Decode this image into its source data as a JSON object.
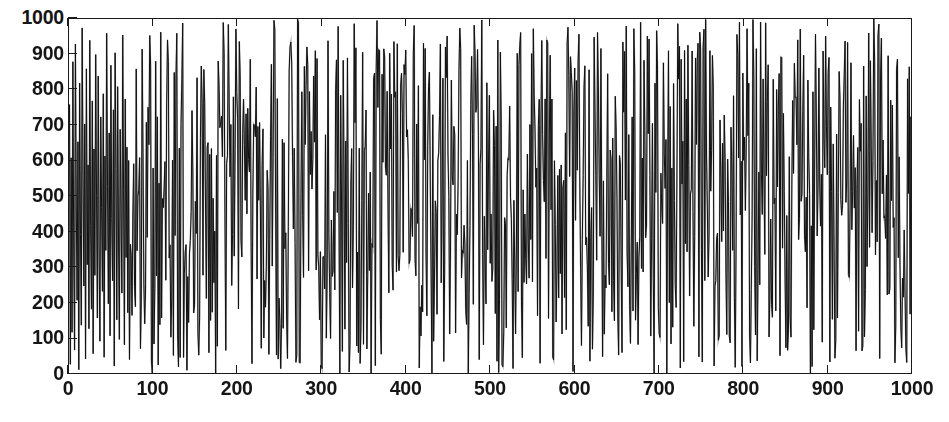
{
  "figure": {
    "background_color": "#ffffff",
    "ink_color": "#1a1a1a",
    "caption_remnant": ""
  },
  "chart_data": {
    "type": "line",
    "title": "",
    "subtitle": "",
    "xlabel": "",
    "ylabel": "",
    "xlim": [
      0,
      1000
    ],
    "ylim": [
      0,
      1000
    ],
    "xticks": [
      0,
      100,
      200,
      300,
      400,
      500,
      600,
      700,
      800,
      900,
      1000
    ],
    "yticks": [
      0,
      100,
      200,
      300,
      400,
      500,
      600,
      700,
      800,
      900,
      1000
    ],
    "xtick_labels": [
      "0",
      "100",
      "200",
      "300",
      "400",
      "500",
      "600",
      "700",
      "800",
      "900",
      "1000"
    ],
    "ytick_labels": [
      "0",
      "100",
      "200",
      "300",
      "400",
      "500",
      "600",
      "700",
      "800",
      "900",
      "1000"
    ],
    "grid": false,
    "legend": null,
    "legend_position": "none",
    "annotations": [],
    "series": [
      {
        "name": "random sequence",
        "color": "#111111",
        "line_width": 1,
        "marker": "none",
        "n_points": 1000,
        "description": "Dense pseudo-random (approximately uniform) sequence of 1000 values spanning the full range 0 to 1000, drawn as a continuous polyline; successive samples are uncorrelated so the trace fills the axes as near-vertical strokes.",
        "distribution": "uniform",
        "value_min": 0,
        "value_max": 1000,
        "value_mean": 500,
        "x": [
          0,
          1000
        ],
        "values_sample": [
          760,
          30,
          610,
          120,
          880,
          340,
          70,
          930,
          480,
          210,
          655,
          15,
          820,
          395,
          140,
          975,
          560,
          250,
          705,
          45,
          860,
          310,
          590,
          130,
          940,
          420,
          185,
          770,
          60,
          635,
          280,
          900,
          505,
          160,
          840,
          365,
          95,
          725,
          470,
          235,
          790,
          50,
          615,
          350,
          960,
          530,
          200,
          680,
          110,
          870,
          440,
          265,
          745,
          25,
          905,
          580,
          155,
          810,
          385,
          100,
          690,
          460,
          230,
          955,
          520,
          85,
          775,
          330,
          640,
          175
        ]
      }
    ]
  },
  "axes": {
    "y_labels": [
      "1000",
      "900",
      "800",
      "700",
      "600",
      "500",
      "400",
      "300",
      "200",
      "100",
      "0"
    ],
    "x_labels": [
      "0",
      "100",
      "200",
      "300",
      "400",
      "500",
      "600",
      "700",
      "800",
      "900",
      "1000"
    ]
  }
}
